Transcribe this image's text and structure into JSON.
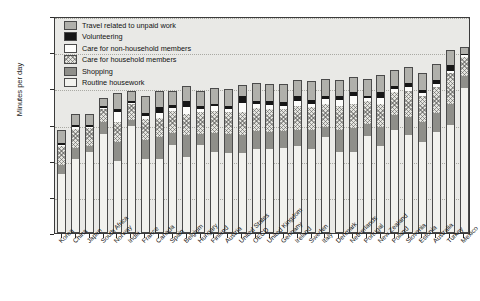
{
  "chart_data": {
    "type": "bar",
    "subtype": "stacked-vertical",
    "title": "",
    "xlabel": "",
    "ylabel": "Minutes per day",
    "ylim": [
      0,
      300
    ],
    "yticks": [
      0,
      50,
      100,
      150,
      200,
      250,
      300
    ],
    "grid": "horizontal-dotted",
    "legend_position": "top-left-inside",
    "stack_order_bottom_to_top": [
      "Routine housework",
      "Shopping",
      "Care for household members",
      "Care for non-household members",
      "Volunteering",
      "Travel related to unpaid work"
    ],
    "categories": [
      "Korea",
      "China",
      "Japan",
      "South Africa",
      "Norway",
      "India",
      "France",
      "Canada",
      "Spain",
      "Belgium",
      "Hungary",
      "Finland",
      "Austria",
      "United States",
      "OECD",
      "United Kingdom",
      "Germany",
      "Ireland",
      "Sweden",
      "Italy",
      "Denmark",
      "Netherlands",
      "Portugal",
      "New Zealand",
      "Poland",
      "Slovenia",
      "Estonia",
      "Australia",
      "Turkey",
      "Mexico"
    ],
    "series": [
      {
        "name": "Routine housework",
        "color": "#f2f2ee",
        "values": [
          82,
          103,
          112,
          137,
          99,
          148,
          103,
          103,
          122,
          105,
          122,
          112,
          110,
          110,
          116,
          116,
          117,
          120,
          116,
          133,
          112,
          112,
          134,
          120,
          143,
          135,
          126,
          140,
          150,
          200
        ]
      },
      {
        "name": "Shopping",
        "color": "#8f8f8a",
        "values": [
          12,
          14,
          9,
          16,
          27,
          8,
          25,
          30,
          16,
          31,
          15,
          26,
          27,
          26,
          25,
          23,
          24,
          23,
          26,
          14,
          31,
          33,
          17,
          27,
          20,
          25,
          27,
          26,
          28,
          17
        ]
      },
      {
        "name": "Care for household members",
        "color": "#e4e4df",
        "pattern": "cross-hatch",
        "values": [
          26,
          27,
          24,
          18,
          27,
          22,
          30,
          26,
          31,
          28,
          30,
          31,
          30,
          32,
          32,
          33,
          30,
          33,
          32,
          32,
          32,
          33,
          31,
          32,
          32,
          36,
          37,
          36,
          43,
          27
        ]
      },
      {
        "name": "Care for non-household members",
        "color": "#fdfdfb",
        "values": [
          2,
          2,
          2,
          2,
          14,
          2,
          4,
          7,
          4,
          10,
          4,
          6,
          4,
          12,
          5,
          5,
          5,
          6,
          5,
          6,
          9,
          11,
          4,
          8,
          4,
          6,
          4,
          4,
          3,
          2
        ]
      },
      {
        "name": "Volunteering",
        "color": "#161616",
        "values": [
          2,
          3,
          3,
          2,
          5,
          2,
          4,
          8,
          4,
          8,
          4,
          4,
          5,
          9,
          5,
          5,
          5,
          8,
          5,
          4,
          6,
          6,
          4,
          8,
          4,
          5,
          4,
          5,
          9,
          2
        ]
      },
      {
        "name": "Travel related to unpaid work",
        "color": "#b0b0ab",
        "values": [
          18,
          16,
          14,
          12,
          22,
          14,
          24,
          22,
          20,
          21,
          22,
          21,
          23,
          16,
          24,
          24,
          25,
          22,
          26,
          24,
          21,
          21,
          23,
          24,
          22,
          22,
          23,
          23,
          20,
          9
        ]
      }
    ]
  },
  "legend": {
    "items": [
      {
        "label": "Travel related to unpaid work",
        "swatch": "s-travel"
      },
      {
        "label": "Volunteering",
        "swatch": "s-vol"
      },
      {
        "label": "Care for non-household members",
        "swatch": "s-carenon"
      },
      {
        "label": "Care for household members",
        "swatch": "s-carehh"
      },
      {
        "label": "Shopping",
        "swatch": "s-shop"
      },
      {
        "label": "Routine housework",
        "swatch": "s-routine"
      }
    ]
  }
}
